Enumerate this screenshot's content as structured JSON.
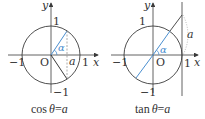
{
  "colors": {
    "ink": "#3a3a3a",
    "accent": "#4a8fd0",
    "dashed": "#888888"
  },
  "left": {
    "caption_func": "cos",
    "caption_theta": "θ",
    "caption_eq": "=",
    "caption_var": "a",
    "axis_x": "x",
    "axis_y": "y",
    "origin": "O",
    "tick_pos": "1",
    "tick_neg": "−1",
    "y_top": "1",
    "y_bottom": "−1",
    "point_label": "a",
    "angle_label": "α"
  },
  "right": {
    "caption_func": "tan",
    "caption_theta": "θ",
    "caption_eq": "=",
    "caption_var": "a",
    "axis_x": "x",
    "axis_y": "y",
    "origin": "O",
    "tick_pos": "1",
    "tick_neg": "−1",
    "y_top": "1",
    "y_bottom": "−1",
    "height_label": "a",
    "angle_label": "α"
  }
}
